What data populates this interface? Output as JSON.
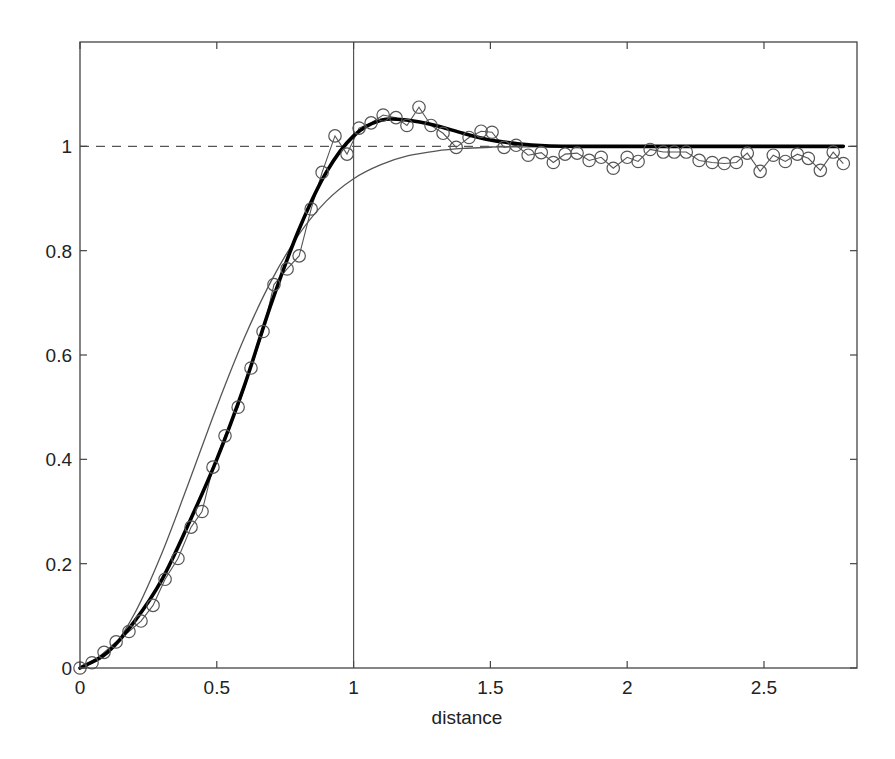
{
  "chart_data": {
    "type": "line",
    "title": "",
    "xlabel": "distance",
    "ylabel": "",
    "xlim": [
      0,
      2.84
    ],
    "ylim": [
      0,
      1.2
    ],
    "grid": false,
    "legend": null,
    "xticks": [
      0,
      0.5,
      1,
      1.5,
      2,
      2.5
    ],
    "xtick_labels": [
      "0",
      "0.5",
      "1",
      "1.5",
      "2",
      "2.5"
    ],
    "yticks": [
      0,
      0.2,
      0.4,
      0.6,
      0.8,
      1
    ],
    "ytick_labels": [
      "0",
      "0.2",
      "0.4",
      "0.6",
      "0.8",
      "1"
    ],
    "reference_lines": [
      {
        "name": "sill",
        "orientation": "horizontal",
        "value": 1,
        "style": "dashed",
        "color": "#555555"
      },
      {
        "name": "range",
        "orientation": "vertical",
        "value": 1,
        "style": "solid",
        "color": "#555555"
      }
    ],
    "series": [
      {
        "name": "empirical",
        "style": "thin line with open circle markers",
        "color": "#555555",
        "x": [
          0.0,
          0.044,
          0.088,
          0.132,
          0.179,
          0.223,
          0.267,
          0.311,
          0.358,
          0.406,
          0.446,
          0.486,
          0.53,
          0.578,
          0.625,
          0.669,
          0.709,
          0.757,
          0.801,
          0.845,
          0.885,
          0.932,
          0.976,
          1.02,
          1.064,
          1.108,
          1.155,
          1.195,
          1.239,
          1.283,
          1.327,
          1.375,
          1.422,
          1.466,
          1.506,
          1.55,
          1.594,
          1.638,
          1.686,
          1.73,
          1.773,
          1.817,
          1.861,
          1.905,
          1.949,
          2.0,
          2.04,
          2.084,
          2.132,
          2.172,
          2.216,
          2.263,
          2.311,
          2.355,
          2.399,
          2.439,
          2.486,
          2.534,
          2.578,
          2.622,
          2.662,
          2.706,
          2.753,
          2.79
        ],
        "y": [
          0.0,
          0.01,
          0.03,
          0.05,
          0.07,
          0.09,
          0.12,
          0.17,
          0.21,
          0.27,
          0.3,
          0.385,
          0.445,
          0.5,
          0.575,
          0.645,
          0.735,
          0.765,
          0.79,
          0.88,
          0.95,
          1.02,
          0.985,
          1.035,
          1.045,
          1.06,
          1.055,
          1.04,
          1.075,
          1.04,
          1.025,
          0.998,
          1.017,
          1.029,
          1.027,
          0.998,
          1.002,
          0.983,
          0.988,
          0.969,
          0.985,
          0.987,
          0.973,
          0.979,
          0.958,
          0.979,
          0.971,
          0.994,
          0.989,
          0.989,
          0.989,
          0.973,
          0.969,
          0.967,
          0.969,
          0.987,
          0.952,
          0.983,
          0.971,
          0.985,
          0.977,
          0.954,
          0.989,
          0.967
        ]
      },
      {
        "name": "fitted model (hole effect)",
        "style": "thick solid line",
        "color": "#000000",
        "x": [
          0,
          0.1,
          0.2,
          0.3,
          0.4,
          0.5,
          0.6,
          0.7,
          0.8,
          0.9,
          1.0,
          1.1,
          1.2,
          1.3,
          1.4,
          1.5,
          1.6,
          1.7,
          1.8,
          2.0,
          2.2,
          2.4,
          2.6,
          2.79
        ],
        "y": [
          0,
          0.03,
          0.09,
          0.17,
          0.28,
          0.4,
          0.54,
          0.7,
          0.84,
          0.95,
          1.02,
          1.05,
          1.05,
          1.04,
          1.025,
          1.012,
          1.005,
          1.001,
          1.0,
          1.0,
          1.0,
          1.0,
          1.0,
          1.0
        ]
      },
      {
        "name": "gaussian model",
        "style": "thin solid line",
        "color": "#555555",
        "x": [
          0,
          0.1,
          0.2,
          0.3,
          0.4,
          0.5,
          0.6,
          0.7,
          0.8,
          0.9,
          1.0,
          1.1,
          1.2,
          1.3,
          1.4,
          1.5,
          1.6
        ],
        "y": [
          0,
          0.027,
          0.105,
          0.221,
          0.359,
          0.501,
          0.632,
          0.743,
          0.831,
          0.895,
          0.938,
          0.965,
          0.982,
          0.991,
          0.996,
          0.998,
          0.999
        ]
      }
    ]
  }
}
